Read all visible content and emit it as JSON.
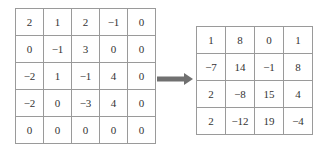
{
  "input_matrix": [
    [
      "2",
      "1",
      "2",
      "−1",
      "0"
    ],
    [
      "0",
      "−1",
      "3",
      "0",
      "0"
    ],
    [
      "−2",
      "1",
      "−1",
      "4",
      "0"
    ],
    [
      "−2",
      "0",
      "−3",
      "4",
      "0"
    ],
    [
      "0",
      "0",
      "0",
      "0",
      "0"
    ]
  ],
  "output_matrix": [
    [
      "1",
      "8",
      "0",
      "1"
    ],
    [
      "−7",
      "14",
      "−1",
      "8"
    ],
    [
      "2",
      "−8",
      "15",
      "4"
    ],
    [
      "2",
      "−12",
      "19",
      "−4"
    ]
  ],
  "arrow_color": "#707070"
}
